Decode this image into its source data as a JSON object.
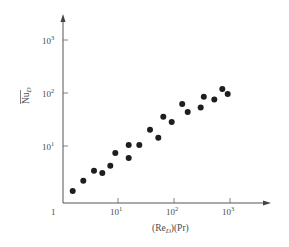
{
  "chart_data": {
    "type": "scatter",
    "title": "",
    "xlabel": "(Re_D)(Pr)",
    "ylabel": "Nu_D (overbar)",
    "xscale": "log",
    "yscale": "log",
    "xlim": [
      1,
      3000
    ],
    "ylim": [
      1,
      3000
    ],
    "grid": false,
    "legend": null,
    "x_ticks": [
      "1",
      "10^1",
      "10^2",
      "10^3"
    ],
    "y_ticks": [
      "10^1",
      "10^2",
      "10^3"
    ],
    "series": [
      {
        "name": "data",
        "marker": "filled-circle",
        "color": "#1e1e1e",
        "points": [
          {
            "x": 1.55,
            "y": 1.53
          },
          {
            "x": 2.4,
            "y": 2.37
          },
          {
            "x": 3.73,
            "y": 3.6
          },
          {
            "x": 5.25,
            "y": 3.28
          },
          {
            "x": 7.3,
            "y": 4.47
          },
          {
            "x": 8.95,
            "y": 7.65
          },
          {
            "x": 15.5,
            "y": 6.2
          },
          {
            "x": 15.5,
            "y": 10.7
          },
          {
            "x": 24,
            "y": 10.7
          },
          {
            "x": 37.3,
            "y": 20.5
          },
          {
            "x": 52.4,
            "y": 14.6
          },
          {
            "x": 64.4,
            "y": 35.7
          },
          {
            "x": 90.8,
            "y": 28.5
          },
          {
            "x": 140,
            "y": 61
          },
          {
            "x": 176,
            "y": 43.5
          },
          {
            "x": 300,
            "y": 53
          },
          {
            "x": 340,
            "y": 83
          },
          {
            "x": 525,
            "y": 74
          },
          {
            "x": 730,
            "y": 116
          },
          {
            "x": 910,
            "y": 93
          }
        ]
      }
    ]
  },
  "labels": {
    "x_origin": "1",
    "x_tick_base": "10",
    "x_tick_exps": [
      "1",
      "2",
      "3"
    ],
    "y_tick_base": "10",
    "y_tick_exps": [
      "1",
      "2",
      "3"
    ],
    "x_axis": {
      "pre": "(Re",
      "sub": "D",
      "post": ")(Pr)"
    },
    "y_axis": {
      "main": "Nu",
      "sub": "D"
    }
  }
}
